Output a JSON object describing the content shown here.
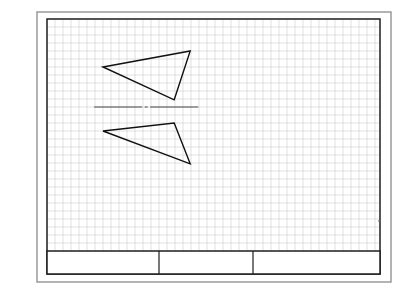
{
  "drawing": {
    "title": "",
    "grid": {
      "visible": true,
      "color": "#cfcfcf"
    },
    "outer_border_color": "#9a9a9a",
    "inner_border_color": "#1e1e1e",
    "line_color": "#111111",
    "shapes": [
      {
        "name": "top-triangle",
        "type": "triangle",
        "points_grid": [
          [
            7,
            6
          ],
          [
            17.9,
            4
          ],
          [
            15.9,
            10.1
          ]
        ]
      },
      {
        "name": "bottom-triangle",
        "type": "triangle",
        "points_grid": [
          [
            7,
            14
          ],
          [
            15.9,
            13
          ],
          [
            17.9,
            18.1
          ]
        ]
      }
    ],
    "center_line": {
      "type": "dash-dot",
      "y_grid": 11,
      "x_start_grid": 5.9,
      "x_end_grid": 18.9
    },
    "title_block": {
      "cells": [
        {
          "label": ""
        },
        {
          "label": ""
        },
        {
          "label": ""
        }
      ]
    }
  }
}
